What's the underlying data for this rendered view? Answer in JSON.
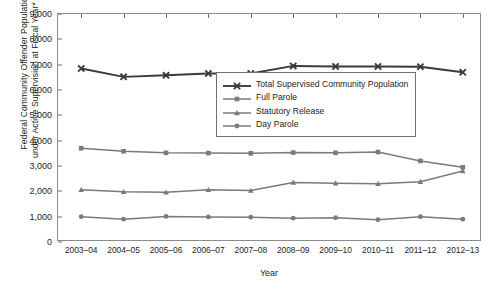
{
  "chart_data": {
    "type": "line",
    "title": "",
    "xlabel": "Year",
    "ylabel": "Federal Community Offender Population under Active Supervision at Fiscal Year* End",
    "ylabel_line1": "Federal Community Offender Population",
    "ylabel_line2": "under Active Supervision at Fiscal Year* End",
    "categories": [
      "2003–04",
      "2004–05",
      "2005–06",
      "2006–07",
      "2007–08",
      "2008–09",
      "2009–10",
      "2010–11",
      "2011–12",
      "2012–13"
    ],
    "ylim": [
      0,
      9000
    ],
    "yticks": [
      0,
      1000,
      2000,
      3000,
      4000,
      5000,
      6000,
      7000,
      8000,
      9000
    ],
    "ytick_labels": [
      "0",
      "1,000",
      "2,000",
      "3,000",
      "4,000",
      "5,000",
      "6,000",
      "7,000",
      "8,000",
      "9,000"
    ],
    "grid": false,
    "legend_position": "inside-upper-right",
    "series": [
      {
        "name": "Total Supervised Community Population",
        "marker": "x",
        "color": "#3a3a3a",
        "width": 1.9,
        "values": [
          6850,
          6520,
          6580,
          6650,
          6650,
          6950,
          6930,
          6930,
          6920,
          6700
        ]
      },
      {
        "name": "Full Parole",
        "marker": "square",
        "color": "#7a7a7a",
        "width": 1.5,
        "values": [
          3700,
          3580,
          3520,
          3510,
          3500,
          3530,
          3520,
          3550,
          3200,
          2950
        ]
      },
      {
        "name": "Statutory Release",
        "marker": "triangle",
        "color": "#7a7a7a",
        "width": 1.5,
        "values": [
          2060,
          1980,
          1960,
          2060,
          2030,
          2350,
          2320,
          2300,
          2380,
          2800
        ]
      },
      {
        "name": "Day Parole",
        "marker": "circle",
        "color": "#7a7a7a",
        "width": 1.5,
        "values": [
          1000,
          900,
          1010,
          990,
          980,
          940,
          960,
          880,
          1000,
          900
        ]
      }
    ]
  }
}
